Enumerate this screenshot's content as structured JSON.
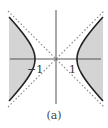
{
  "figure": {
    "caption": "(a)",
    "labels": {
      "left_vertex": "−1",
      "right_vertex": "1"
    },
    "colors": {
      "shade": "#d4d4d4",
      "curve": "#222222",
      "axis": "#555555",
      "asymptote": "#8a8a8a"
    },
    "geometry": {
      "origin_px": [
        56,
        59
      ],
      "unit_px": 21,
      "x_axis_px": [
        10,
        101
      ],
      "y_axis_px": [
        10,
        104
      ],
      "asymptote_extent_px": 48,
      "branch_y_extent_px": 42
    }
  },
  "chart_data": {
    "type": "diagram",
    "title": "",
    "curves": [
      {
        "name": "hyperbola",
        "equation": "x^2 - y^2 = 1",
        "style": "solid"
      },
      {
        "name": "asymptote_pos",
        "equation": "y = x",
        "style": "dotted"
      },
      {
        "name": "asymptote_neg",
        "equation": "y = -x",
        "style": "dotted"
      }
    ],
    "shaded_region": "x^2 - y^2 >= 1",
    "tick_labels": [
      "−1",
      "1"
    ],
    "xlim": [
      -2.2,
      2.2
    ],
    "ylim": [
      -2.2,
      2.2
    ],
    "axes": "centered",
    "grid": false
  }
}
